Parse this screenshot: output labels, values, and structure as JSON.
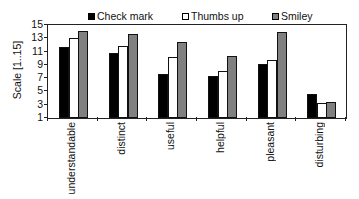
{
  "chart_data": {
    "type": "bar",
    "title": "",
    "xlabel": "",
    "ylabel": "Scale [1..15]",
    "ylim": [
      1,
      15
    ],
    "yticks": [
      1,
      3,
      5,
      7,
      9,
      11,
      13,
      15
    ],
    "grid": false,
    "legend_position": "top",
    "categories": [
      "understandable",
      "distinct",
      "useful",
      "helpful",
      "pleasant",
      "disturbing"
    ],
    "series": [
      {
        "name": "Check mark",
        "color": "#000000",
        "values": [
          11.7,
          10.8,
          7.7,
          7.3,
          9.1,
          4.6
        ]
      },
      {
        "name": "Thumbs up",
        "color": "#ffffff",
        "values": [
          13.0,
          11.8,
          10.2,
          8.1,
          9.8,
          3.2
        ]
      },
      {
        "name": "Smiley",
        "color": "#808080",
        "values": [
          14.1,
          13.7,
          12.5,
          10.3,
          14.0,
          3.4
        ]
      }
    ]
  }
}
